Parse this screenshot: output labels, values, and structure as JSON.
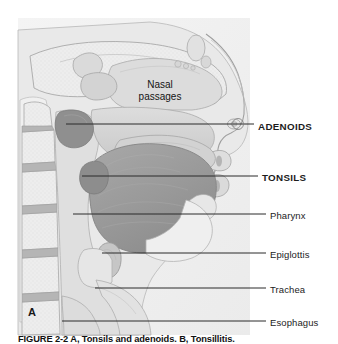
{
  "figure": {
    "panel_letter": "A",
    "caption": "FIGURE 2-2    A, Tonsils and adenoids. B, Tonsillitis.",
    "inner_labels": [
      {
        "name": "nasal-passages",
        "line1": "Nasal",
        "line2": "passages"
      }
    ],
    "callouts": [
      {
        "id": "adenoids",
        "label": "ADENOIDS",
        "bold": true,
        "label_x": 258,
        "label_y": 122,
        "line_x1": 66,
        "line_y1": 124,
        "line_x2": 254,
        "line_y2": 124,
        "marker": true,
        "marker_x": 238,
        "marker_y": 124
      },
      {
        "id": "tonsils",
        "label": "TONSILS",
        "bold": true,
        "label_x": 262,
        "label_y": 173,
        "line_x1": 82,
        "line_y1": 176,
        "line_x2": 258,
        "line_y2": 176,
        "marker": false
      },
      {
        "id": "pharynx",
        "label": "Pharynx",
        "bold": false,
        "label_x": 270,
        "label_y": 211,
        "line_x1": 73,
        "line_y1": 214,
        "line_x2": 266,
        "line_y2": 214,
        "marker": false
      },
      {
        "id": "epiglottis",
        "label": "Epiglottis",
        "bold": false,
        "label_x": 270,
        "label_y": 250,
        "line_x1": 102,
        "line_y1": 253,
        "line_x2": 266,
        "line_y2": 253,
        "marker": false
      },
      {
        "id": "trachea",
        "label": "Trachea",
        "bold": false,
        "label_x": 270,
        "label_y": 285,
        "line_x1": 95,
        "line_y1": 288,
        "line_x2": 266,
        "line_y2": 288,
        "marker": false
      },
      {
        "id": "esophagus",
        "label": "Esophagus",
        "bold": false,
        "label_x": 270,
        "label_y": 318,
        "line_x1": 62,
        "line_y1": 321,
        "line_x2": 266,
        "line_y2": 321,
        "marker": false
      }
    ],
    "colors": {
      "page_background": "#ffffff",
      "illustration_background": "#f2f2f2",
      "tissue_light": "#e4e4e4",
      "tissue_mid": "#cfcfcf",
      "tissue_dark": "#b3b3b3",
      "tongue": "#9d9d9d",
      "adenoid": "#8f8f8f",
      "bone_fill": "#ededed",
      "outline": "#9a9a9a",
      "leader_line": "#2a2a2a",
      "label_text": "#1c1c1c"
    }
  }
}
